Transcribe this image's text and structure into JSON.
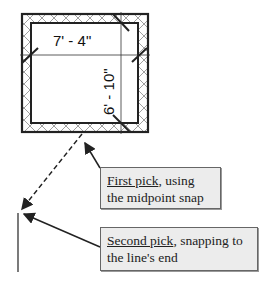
{
  "diagram": {
    "dimensions": {
      "horizontal": "7' - 4\"",
      "vertical": "6' - 10\""
    },
    "callouts": [
      {
        "underlined": "First pick",
        "rest": ", using the midpoint snap"
      },
      {
        "underlined": "Second pick",
        "rest": ", snapping to the line's end"
      }
    ],
    "colors": {
      "line": "#222222",
      "callout_bg": "#ececec",
      "callout_border": "#666666"
    }
  }
}
